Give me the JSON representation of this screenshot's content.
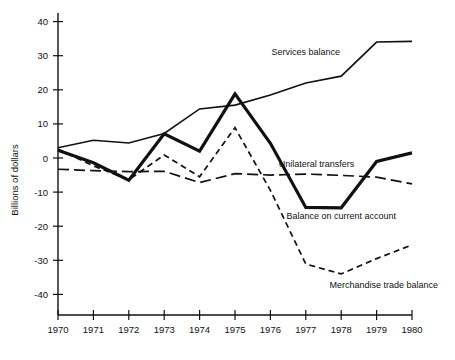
{
  "chart_data": {
    "type": "line",
    "title": "",
    "xlabel": "",
    "ylabel": "Billions of dollars",
    "x": [
      1970,
      1971,
      1972,
      1973,
      1974,
      1975,
      1976,
      1977,
      1978,
      1979,
      1980
    ],
    "xticklabels": [
      "1970",
      "1971",
      "1972",
      "1973",
      "1974",
      "1975",
      "1976",
      "1977",
      "1978",
      "1979",
      "1980"
    ],
    "yticklabels": [
      "40",
      "30",
      "20",
      "10",
      "0",
      "-10",
      "-20",
      "-30",
      "-40"
    ],
    "yticks": [
      40,
      30,
      20,
      10,
      0,
      -10,
      -20,
      -30,
      -40
    ],
    "ylim": [
      -45,
      42
    ],
    "xlim": [
      1970,
      1980
    ],
    "grid": false,
    "legend": "inline-annotations",
    "series": [
      {
        "name": "Services balance",
        "style": "solid-thin",
        "values": [
          3.0,
          5.2,
          4.4,
          7.2,
          14.4,
          15.5,
          18.5,
          22.0,
          24.0,
          34.0,
          34.2
        ]
      },
      {
        "name": "Balance on current account",
        "style": "solid-thick",
        "values": [
          2.3,
          -1.4,
          -6.5,
          7.1,
          2.0,
          18.8,
          4.3,
          -14.5,
          -14.6,
          -1.0,
          1.5
        ]
      },
      {
        "name": "Merchandise trade balance",
        "style": "dashed-short",
        "values": [
          2.6,
          -2.3,
          -6.4,
          0.9,
          -5.5,
          8.9,
          -9.5,
          -31.1,
          -34.0,
          -29.5,
          -25.5
        ]
      },
      {
        "name": "Unilateral transfers",
        "style": "dashed-long",
        "values": [
          -3.3,
          -3.7,
          -4.0,
          -3.9,
          -7.2,
          -4.6,
          -5.0,
          -4.7,
          -5.1,
          -5.6,
          -7.6
        ]
      }
    ],
    "annotations": [
      {
        "text": "Services balance",
        "x": 1977.0,
        "y": 30.2
      },
      {
        "text": "Unilateral transfers",
        "x": 1977.3,
        "y": -2.6
      },
      {
        "text": "Balance on current account",
        "x": 1978.0,
        "y": -18.0
      },
      {
        "text": "Merchandise trade balance",
        "x": 1979.2,
        "y": -38.0
      }
    ]
  }
}
